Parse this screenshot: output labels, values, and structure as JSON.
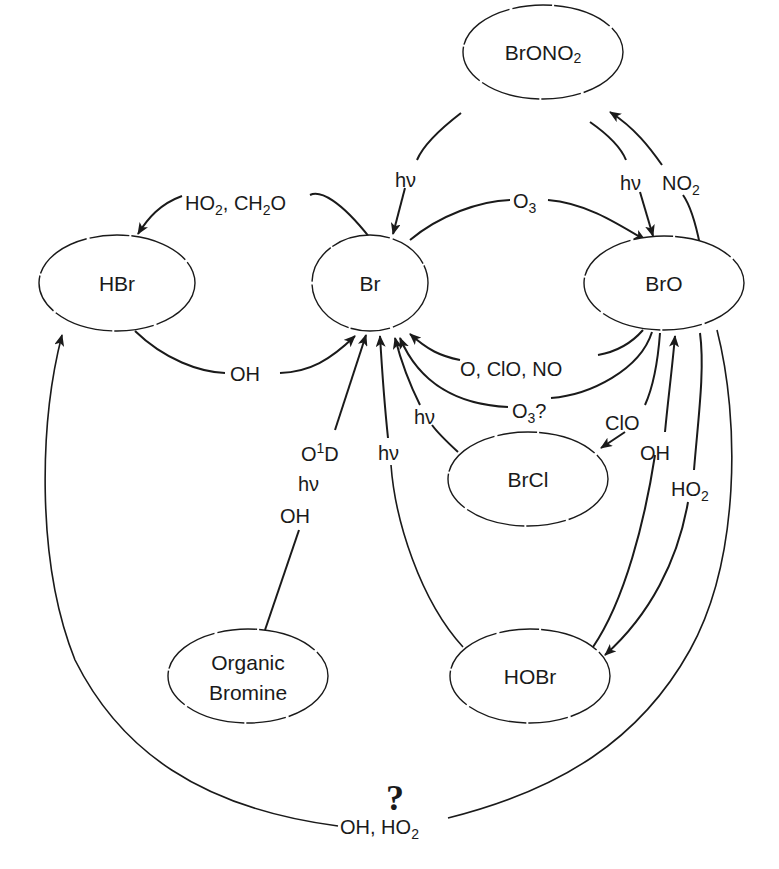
{
  "diagram": {
    "colors": {
      "ink": "#1a1a1a",
      "background": "#ffffff"
    },
    "nodes": {
      "bronono2": {
        "label": "BrONO",
        "sub": "2"
      },
      "hbr": {
        "label": "HBr"
      },
      "br": {
        "label": "Br"
      },
      "bro": {
        "label": "BrO"
      },
      "brcl": {
        "label": "BrCl"
      },
      "organic": {
        "line1": "Organic",
        "line2": "Bromine"
      },
      "hobr": {
        "label": "HOBr"
      }
    },
    "edges": {
      "br_to_hbr": {
        "from": "Br",
        "to": "HBr",
        "label_a": "HO",
        "sub_a": "2",
        "label_b": ", CH",
        "sub_b": "2",
        "label_c": "O"
      },
      "hbr_to_br": {
        "from": "HBr",
        "to": "Br",
        "label": "OH"
      },
      "br_to_bro": {
        "from": "Br",
        "to": "BrO",
        "label": "O",
        "sub": "3"
      },
      "bronono2_to_br": {
        "from": "BrONO2",
        "to": "Br",
        "label": "hν"
      },
      "bronono2_to_bro": {
        "from": "BrONO2",
        "to": "BrO",
        "label": "hν"
      },
      "bro_to_bronono2": {
        "from": "BrO",
        "to": "BrONO2",
        "label": "NO",
        "sub": "2"
      },
      "bro_to_br_a": {
        "from": "BrO",
        "to": "Br",
        "label": "O, ClO, NO"
      },
      "bro_to_br_b": {
        "from": "BrO",
        "to": "Br",
        "label": "O",
        "sub": "3",
        "suffix": "?"
      },
      "brcl_to_br": {
        "from": "BrCl",
        "to": "Br",
        "label": "hν"
      },
      "bro_to_brcl": {
        "from": "BrO",
        "to": "BrCl",
        "label": "ClO"
      },
      "hobr_to_bro": {
        "from": "HOBr",
        "to": "BrO",
        "label": "OH"
      },
      "bro_to_hobr": {
        "from": "BrO",
        "to": "HOBr",
        "label": "HO",
        "sub": "2"
      },
      "hobr_to_br": {
        "from": "HOBr",
        "to": "Br",
        "label": "hν"
      },
      "organic_to_br": {
        "from": "Organic Bromine",
        "to": "Br",
        "label_1": "O",
        "sup_1": "1",
        "label_1b": "D",
        "label_2": "hν",
        "label_3": "OH"
      },
      "bro_to_hbr": {
        "from": "BrO",
        "to": "HBr",
        "question": "?",
        "label": "OH, HO",
        "sub": "2"
      }
    }
  }
}
